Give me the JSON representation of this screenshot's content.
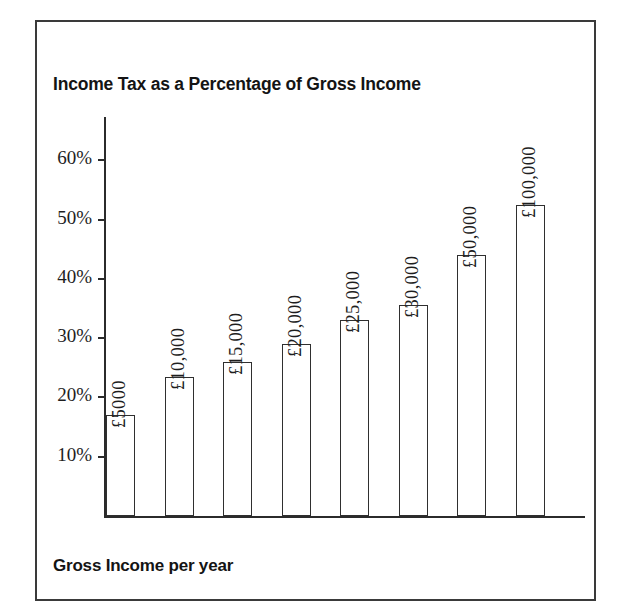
{
  "chart_data": {
    "type": "bar",
    "title": "Income Tax as a Percentage of Gross Income",
    "xlabel": "Gross Income per year",
    "ylabel": "",
    "categories": [
      "£5000",
      "£10,000",
      "£15,000",
      "£20,000",
      "£25,000",
      "£30,000",
      "£50,000",
      "£100,000"
    ],
    "values": [
      17,
      23.5,
      26,
      29,
      33,
      35.5,
      44,
      52.5
    ],
    "value_unit": "%",
    "ylim": [
      0,
      65
    ],
    "yticks": [
      10,
      20,
      30,
      40,
      50,
      60
    ],
    "ytick_labels": [
      "10%",
      "20%",
      "30%",
      "40%",
      "50%",
      "60%"
    ],
    "grid": false,
    "legend": false,
    "bar_fill_color": "#ffffff",
    "bar_edge_color": "#2f2f2f",
    "axis_color": "#2b2b2b",
    "frame_color": "#3a3a3a",
    "text_color": "#141414",
    "background_color": "#ffffff"
  }
}
